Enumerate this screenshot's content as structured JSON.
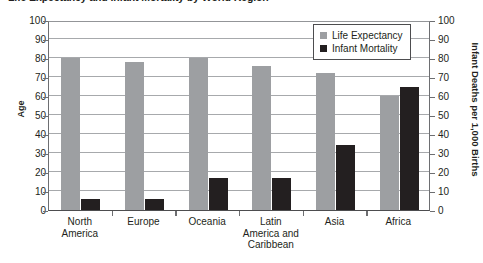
{
  "chart_data": {
    "type": "bar",
    "title": "Life Expectancy and Infant Mortality by World Region",
    "categories": [
      "North America",
      "Europe",
      "Oceania",
      "Latin America and Caribbean",
      "Asia",
      "Africa"
    ],
    "series": [
      {
        "name": "Life Expectancy",
        "values": [
          80,
          78,
          80,
          76,
          72,
          60
        ],
        "color": "#9d9fa2",
        "axis": "left"
      },
      {
        "name": "Infant Mortality",
        "values": [
          6,
          6,
          17,
          17,
          34,
          65
        ],
        "color": "#231f20",
        "axis": "right"
      }
    ],
    "xlabel": "",
    "ylabel": "Age",
    "y2label": "Infant Deaths per 1,000 Births",
    "ylim": [
      0,
      100
    ],
    "y2lim": [
      0,
      100
    ],
    "yticks": [
      0,
      10,
      20,
      30,
      40,
      50,
      60,
      70,
      80,
      90,
      100
    ],
    "y2ticks": [
      0,
      10,
      20,
      30,
      40,
      50,
      60,
      70,
      80,
      90,
      100
    ],
    "grid": true,
    "legend_position": "upper-right"
  },
  "axes": {
    "left_title": "Age",
    "right_title": "Infant Deaths per 1,000 Births",
    "tick_labels": [
      "100",
      "90",
      "80",
      "70",
      "60",
      "50",
      "40",
      "30",
      "20",
      "10",
      "0"
    ]
  },
  "legend": {
    "items": [
      {
        "label": "Life Expectancy",
        "swatch": "life"
      },
      {
        "label": "Infant Mortality",
        "swatch": "infant"
      }
    ]
  },
  "categories": [
    {
      "lines": [
        "North",
        "America"
      ]
    },
    {
      "lines": [
        "Europe"
      ]
    },
    {
      "lines": [
        "Oceania"
      ]
    },
    {
      "lines": [
        "Latin",
        "America and",
        "Caribbean"
      ]
    },
    {
      "lines": [
        "Asia"
      ]
    },
    {
      "lines": [
        "Africa"
      ]
    }
  ]
}
